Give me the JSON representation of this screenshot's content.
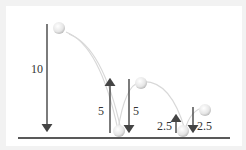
{
  "diagram": {
    "labels": {
      "drop1": "10",
      "rise1": "5",
      "drop2": "5",
      "rise2": "2.5",
      "drop3": "2.5"
    },
    "colors": {
      "arrow": "#444444",
      "ground": "#222222",
      "ball": "#e8e8e8",
      "path": "#d8d8d8",
      "background": "#ffffff",
      "border": "#f2f2f2"
    }
  }
}
